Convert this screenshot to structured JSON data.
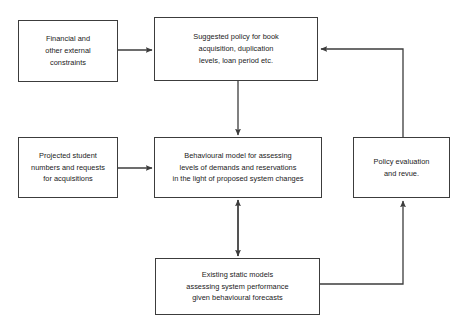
{
  "diagram": {
    "background_color": "#ffffff",
    "line_color": "#3c3c3c",
    "text_color": "#1a1a1a",
    "nodes": [
      {
        "id": "financial",
        "label": "Financial and\nother external\nconstraints"
      },
      {
        "id": "policy_suggested",
        "label": "Suggested policy for book\nacquisition, duplication\nlevels, loan period etc."
      },
      {
        "id": "projected",
        "label": "Projected student\nnumbers and requests\nfor acquisitions"
      },
      {
        "id": "behavioural",
        "label": "Behavioural model for assessing\nlevels of demands and reservations\nin the light of proposed system changes"
      },
      {
        "id": "evaluation",
        "label": "Policy evaluation\nand revue."
      },
      {
        "id": "existing",
        "label": "Existing static models\nassessing system performance\ngiven behavioural forecasts"
      }
    ],
    "edges": [
      {
        "id": "financial-to-policy",
        "from": "financial",
        "to": "policy_suggested",
        "style": "straight-horizontal"
      },
      {
        "id": "policy-to-behavioural",
        "from": "policy_suggested",
        "to": "behavioural",
        "style": "straight-vertical"
      },
      {
        "id": "projected-to-behavioural",
        "from": "projected",
        "to": "behavioural",
        "style": "straight-horizontal"
      },
      {
        "id": "behavioural-to-existing",
        "from": "behavioural",
        "to": "existing",
        "style": "double-headed-vertical"
      },
      {
        "id": "existing-to-evaluation",
        "from": "existing",
        "to": "evaluation",
        "style": "elbow"
      },
      {
        "id": "evaluation-to-policy",
        "from": "evaluation",
        "to": "policy_suggested",
        "style": "elbow"
      }
    ]
  }
}
